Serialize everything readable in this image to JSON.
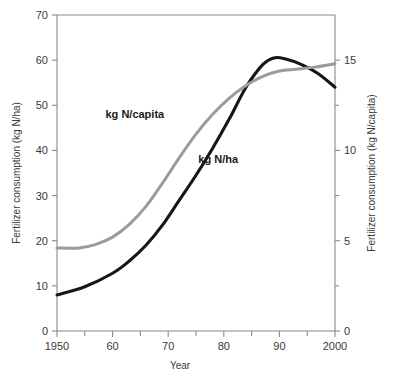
{
  "chart_data": {
    "type": "line",
    "title": "",
    "subtitle": "",
    "xlabel": "Year",
    "ylabel": "Fertilizer consumption (kg N/ha)",
    "ylabel_right": "Fertilizer consumption (kg N/capita)",
    "grid": false,
    "legend_position": "inline-annotations",
    "xlim": [
      1950,
      2000
    ],
    "xticks": [
      1950,
      1960,
      1970,
      1980,
      1990,
      2000
    ],
    "xticklabels": [
      "1950",
      "60",
      "70",
      "80",
      "90",
      "2000"
    ],
    "xminorticks": [
      1955,
      1965,
      1975,
      1985,
      1995
    ],
    "ylim": [
      0,
      70
    ],
    "yticks": [
      0,
      10,
      20,
      30,
      40,
      50,
      60,
      70
    ],
    "yticklabels": [
      "0",
      "10",
      "20",
      "30",
      "40",
      "50",
      "60",
      "70"
    ],
    "ylim_right": [
      0,
      17.5
    ],
    "yticks_right": [
      0,
      5,
      10,
      15
    ],
    "yticklabels_right": [
      "0",
      "5",
      "10",
      "15"
    ],
    "yminorticks_right": [
      2.5,
      7.5,
      12.5
    ],
    "series": [
      {
        "name": "kg N/capita",
        "axis": "left",
        "color": "#161616",
        "width": 3.1,
        "annotation": "kg N/capita",
        "x": [
          1950,
          1955,
          1960,
          1963,
          1966,
          1969,
          1972,
          1975,
          1978,
          1981,
          1984,
          1987,
          1989,
          1991,
          1994,
          1997,
          2000
        ],
        "values": [
          8.0,
          9.8,
          12.8,
          15.5,
          19.0,
          23.5,
          29.0,
          34.5,
          40.5,
          47.0,
          54.0,
          59.0,
          60.5,
          60.3,
          59.0,
          57.0,
          54.0
        ]
      },
      {
        "name": "kg N/ha",
        "axis": "right",
        "color": "#9b9b9b",
        "width": 3.0,
        "annotation": "kg N/ha",
        "x": [
          1950,
          1954,
          1957,
          1960,
          1963,
          1966,
          1969,
          1972,
          1975,
          1978,
          1981,
          1984,
          1987,
          1990,
          1993,
          1996,
          2000
        ],
        "values": [
          4.6,
          4.6,
          4.8,
          5.2,
          5.9,
          6.9,
          8.2,
          9.6,
          10.9,
          12.0,
          12.9,
          13.6,
          14.1,
          14.4,
          14.5,
          14.6,
          14.8
        ]
      }
    ],
    "annotations": [
      {
        "text": "kg N/capita",
        "x": 1964,
        "y_px": 118
      },
      {
        "text": "kg N/ha",
        "x": 1979,
        "y_px": 163
      }
    ]
  }
}
